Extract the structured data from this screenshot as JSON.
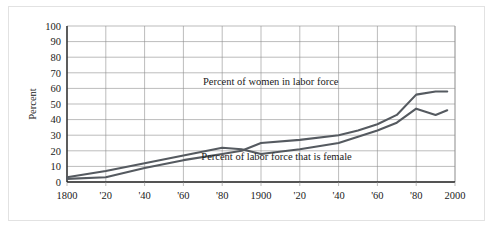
{
  "chart_data": {
    "type": "line",
    "title": "",
    "xlabel": "",
    "ylabel": "Percent",
    "xlim": [
      1800,
      2000
    ],
    "ylim": [
      0,
      100
    ],
    "grid": true,
    "legend_position": "inline-annotations",
    "x_tick_values": [
      1800,
      1820,
      1840,
      1860,
      1880,
      1900,
      1920,
      1940,
      1960,
      1980,
      2000
    ],
    "x_tick_labels": [
      "1800",
      "'20",
      "'40",
      "'60",
      "'80",
      "1900",
      "'20",
      "'40",
      "'60",
      "'80",
      "2000"
    ],
    "y_tick_values": [
      0,
      10,
      20,
      30,
      40,
      50,
      60,
      70,
      80,
      90,
      100
    ],
    "y_tick_labels": [
      "0",
      "10",
      "20",
      "30",
      "40",
      "50",
      "60",
      "70",
      "80",
      "90",
      "100"
    ],
    "series": [
      {
        "name": "Percent of women in labor force",
        "color": "#555a60",
        "annotation": "Percent of women in labor force",
        "annotation_x": 1905,
        "annotation_y": 62,
        "x": [
          1800,
          1820,
          1840,
          1860,
          1880,
          1890,
          1900,
          1920,
          1940,
          1950,
          1960,
          1970,
          1980,
          1990,
          1996
        ],
        "y": [
          2,
          3,
          9,
          14,
          18,
          20,
          25,
          27,
          30,
          33,
          37,
          43,
          56,
          58,
          58
        ]
      },
      {
        "name": "Percent of labor force that is female",
        "color": "#555a60",
        "annotation": "Percent of labor force that is female",
        "annotation_x": 1908,
        "annotation_y": 14,
        "x": [
          1800,
          1820,
          1840,
          1860,
          1880,
          1890,
          1900,
          1920,
          1940,
          1950,
          1960,
          1970,
          1980,
          1990,
          1996
        ],
        "y": [
          3,
          7,
          12,
          17,
          22,
          21,
          18,
          21,
          25,
          29,
          33,
          38,
          47,
          43,
          46
        ]
      }
    ]
  },
  "axes": {
    "y_axis_title": "Percent"
  }
}
